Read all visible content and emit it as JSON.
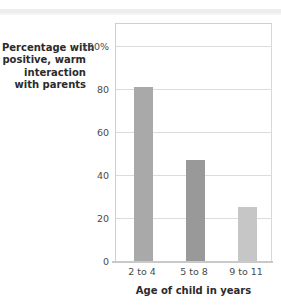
{
  "chart_data": {
    "type": "bar",
    "title": "",
    "categories": [
      "2 to 4",
      "5 to 8",
      "9 to 11"
    ],
    "values": [
      81,
      47,
      25
    ],
    "xlabel": "Age of child in years",
    "ylabel": "Percentage with positive, warm interaction with parents",
    "ylabel_lines": [
      "Percentage with",
      "positive, warm",
      "interaction",
      "with parents"
    ],
    "ylim": [
      0,
      100
    ],
    "yticks": [
      0,
      20,
      40,
      60,
      80,
      100
    ],
    "ytick_labels": [
      "0",
      "20",
      "40",
      "60",
      "80",
      "100%"
    ],
    "grid": true,
    "legend": false,
    "bar_colors": [
      "#a9a9a9",
      "#999999",
      "#c6c6c6"
    ],
    "gridline_color": "#dcdcdc",
    "frame_color": "#cfcfcf",
    "axis_text_color": "#4a4a4a",
    "label_text_color": "#2b2b2b"
  }
}
